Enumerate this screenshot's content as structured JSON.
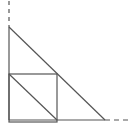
{
  "diagram": {
    "title": "",
    "stroke_color": "#555555",
    "background": "#ffffff",
    "axes": {
      "vertical": {
        "x": 9,
        "y_solid_top": 27,
        "y_bottom": 120,
        "y_dash_top": 1,
        "dash": "4,4"
      },
      "horizontal": {
        "y": 120,
        "x_left": 9,
        "x_solid_right": 105,
        "x_dash_right": 131,
        "dash": "5,4"
      }
    },
    "large_triangle": {
      "points": [
        [
          9,
          27
        ],
        [
          9,
          120
        ],
        [
          105,
          120
        ]
      ]
    },
    "square": {
      "x": 9,
      "y": 74,
      "size": 48
    },
    "inner_diagonal": {
      "from": [
        9,
        74
      ],
      "to": [
        57,
        120
      ]
    }
  }
}
